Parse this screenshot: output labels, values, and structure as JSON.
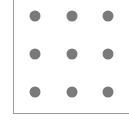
{
  "pattern_grid": {
    "rows": 3,
    "cols": 3,
    "dot_color": "#7a7a7a",
    "border_color": "#9a9a9a",
    "dots": [
      {
        "row": 1,
        "col": 1,
        "x": 35,
        "y": 16
      },
      {
        "row": 1,
        "col": 2,
        "x": 72,
        "y": 16
      },
      {
        "row": 1,
        "col": 3,
        "x": 108,
        "y": 16
      },
      {
        "row": 2,
        "col": 1,
        "x": 35,
        "y": 54
      },
      {
        "row": 2,
        "col": 2,
        "x": 72,
        "y": 54
      },
      {
        "row": 2,
        "col": 3,
        "x": 108,
        "y": 54
      },
      {
        "row": 3,
        "col": 1,
        "x": 35,
        "y": 92
      },
      {
        "row": 3,
        "col": 2,
        "x": 72,
        "y": 92
      },
      {
        "row": 3,
        "col": 3,
        "x": 108,
        "y": 92
      }
    ]
  }
}
